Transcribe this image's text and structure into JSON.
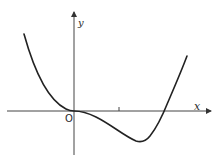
{
  "figure": {
    "type": "function-graph",
    "axes": {
      "x_label": "x",
      "y_label": "y",
      "origin_label": "O",
      "tick_marks": [
        {
          "axis": "x",
          "position": "unit 1"
        }
      ]
    },
    "curve": {
      "description": "Quartic-like curve: decreasing from upper left, flat inflection at origin, local minimum in fourth quadrant right of tick 1, then rising steeply and crossing the positive x-axis",
      "features": [
        "passes through origin with horizontal tangent",
        "minimum below x-axis",
        "single positive x-intercept"
      ]
    },
    "colors": {
      "stroke": "#222222",
      "axis": "#444444",
      "background": "#ffffff"
    }
  }
}
